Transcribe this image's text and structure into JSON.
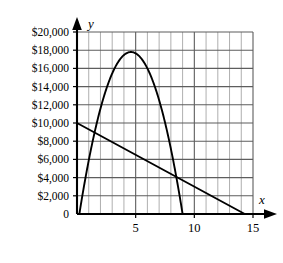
{
  "chart_data": {
    "type": "line",
    "title": "",
    "xlabel": "x",
    "ylabel": "y",
    "xlim": [
      0,
      15
    ],
    "ylim": [
      0,
      20000
    ],
    "grid": true,
    "legend": "none",
    "x_ticks": [
      5,
      10,
      15
    ],
    "x_tick_labels": [
      "5",
      "10",
      "15"
    ],
    "x_minor_step": 1,
    "y_ticks": [
      0,
      2000,
      4000,
      6000,
      8000,
      10000,
      12000,
      14000,
      16000,
      18000,
      20000
    ],
    "y_tick_labels": [
      "0",
      "$2,000",
      "$4,000",
      "$6,000",
      "$8,000",
      "$10,000",
      "$12,000",
      "$14,000",
      "$16,000",
      "$18,000",
      "$20,000"
    ],
    "origin_label": "0",
    "series": [
      {
        "name": "parabola",
        "kind": "quadratic",
        "roots": [
          0.2,
          9.0
        ],
        "vertex": [
          4.6,
          17800
        ],
        "points": [
          [
            0.2,
            0
          ],
          [
            0.5,
            1270
          ],
          [
            1.0,
            3440
          ],
          [
            1.5,
            5440
          ],
          [
            2.0,
            7280
          ],
          [
            2.5,
            8950
          ],
          [
            3.0,
            10450
          ],
          [
            3.5,
            11790
          ],
          [
            4.0,
            12960
          ],
          [
            4.6,
            14140
          ],
          [
            5.0,
            14790
          ],
          [
            5.5,
            15450
          ],
          [
            6.0,
            15940
          ],
          [
            6.5,
            16270
          ],
          [
            7.0,
            16430
          ],
          [
            7.5,
            16430
          ],
          [
            8.0,
            16260
          ],
          [
            8.5,
            15930
          ],
          [
            9.0,
            15430
          ]
        ]
      },
      {
        "name": "line",
        "kind": "linear",
        "intercept_y": 10000,
        "intercept_x": 14.3,
        "points": [
          [
            0,
            10000
          ],
          [
            14.3,
            0
          ]
        ]
      }
    ]
  },
  "axes": {
    "y_axis_name": "y",
    "x_axis_name": "x"
  }
}
